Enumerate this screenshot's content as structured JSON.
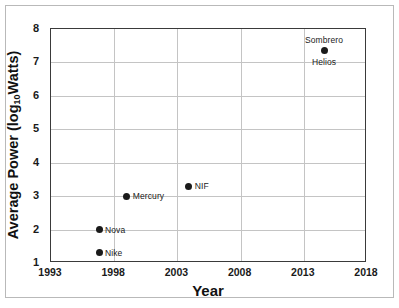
{
  "chart_data": {
    "type": "scatter",
    "title": "",
    "xlabel": "Year",
    "ylabel_parts": {
      "pre": "Average Power (log",
      "sub": "10",
      "post": "Watts)"
    },
    "ylabel": "Average Power (log10Watts)",
    "xlim": [
      1993,
      2018
    ],
    "ylim": [
      1,
      8
    ],
    "xticks": [
      1993,
      1998,
      2003,
      2008,
      2013,
      2018
    ],
    "xtick_labels": [
      "1993",
      "1998",
      "2003",
      "2008",
      "2013",
      "2018"
    ],
    "yticks": [
      1,
      2,
      3,
      4,
      5,
      6,
      7,
      8
    ],
    "ytick_labels": [
      "1",
      "2",
      "3",
      "4",
      "5",
      "6",
      "7",
      "8"
    ],
    "grid": true,
    "grid_color": "#c4c4c4",
    "grid_x_values": [
      1998,
      2003,
      2008,
      2013
    ],
    "grid_y_values": [
      2,
      3,
      4,
      5,
      6,
      7
    ],
    "legend": "none",
    "marker_color": "#1a1a1a",
    "points": [
      {
        "label": "Nike",
        "x": 1996.8,
        "y": 1.3,
        "label_pos": "right"
      },
      {
        "label": "Nova",
        "x": 1996.8,
        "y": 2.0,
        "label_pos": "right"
      },
      {
        "label": "Mercury",
        "x": 1999.0,
        "y": 3.0,
        "label_pos": "right"
      },
      {
        "label": "NIF",
        "x": 2003.9,
        "y": 3.3,
        "label_pos": "right"
      },
      {
        "label": "Sombrero",
        "x": 2014.6,
        "y": 7.35,
        "label_pos": "above"
      },
      {
        "label": "Helios",
        "x": 2014.6,
        "y": 7.35,
        "label_pos": "below",
        "same_marker_as": 4
      }
    ]
  }
}
